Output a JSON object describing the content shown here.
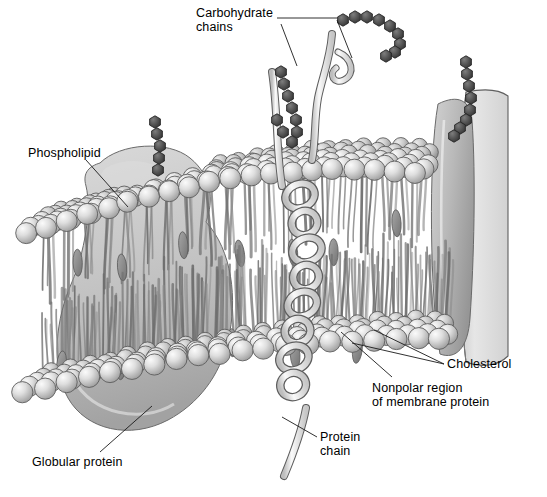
{
  "figure": {
    "background_color": "#ffffff",
    "ink_color": "#1a1a1a",
    "palette": {
      "head_light": "#e9e9e9",
      "head_mid": "#c6c6c6",
      "head_dark": "#8e8e8e",
      "tail_light": "#d8d8d8",
      "tail_dark": "#6f6f6f",
      "protein_fill": "#c0c0c0",
      "protein_shade": "#9a9a9a",
      "helix_fill": "#efefef",
      "carb_bead": "#555555",
      "cholesterol": "#8c8c8c",
      "cut_face": "#dcdcdc"
    }
  },
  "labels": [
    {
      "id": "carbohydrate-chains",
      "text": "Carbohydrate\nchains",
      "x": 196,
      "y": 6,
      "align": "left"
    },
    {
      "id": "phospholipid",
      "text": "Phospholipid",
      "x": 28,
      "y": 146,
      "align": "left"
    },
    {
      "id": "cholesterol",
      "text": "Cholesterol",
      "x": 447,
      "y": 357,
      "align": "left"
    },
    {
      "id": "nonpolar-region",
      "text": "Nonpolar region\nof membrane protein",
      "x": 372,
      "y": 381,
      "align": "left"
    },
    {
      "id": "protein-chain",
      "text": "Protein\nchain",
      "x": 320,
      "y": 430,
      "align": "left"
    },
    {
      "id": "globular-protein",
      "text": "Globular protein",
      "x": 32,
      "y": 455,
      "align": "left"
    }
  ],
  "leader_lines": [
    {
      "id": "leader-carbohydrate-top",
      "from": [
        277,
        18
      ],
      "to": [
        337,
        18
      ]
    },
    {
      "id": "leader-carbohydrate-left",
      "from": [
        281,
        24
      ],
      "to": [
        297,
        66
      ]
    },
    {
      "id": "leader-carbohydrate-right",
      "from": [
        337,
        20
      ],
      "to": [
        352,
        58
      ]
    },
    {
      "id": "leader-phospholipid",
      "from": [
        86,
        160
      ],
      "to": [
        128,
        207
      ]
    },
    {
      "id": "leader-cholesterol-a",
      "from": [
        444,
        364
      ],
      "to": [
        374,
        330
      ]
    },
    {
      "id": "leader-cholesterol-b",
      "from": [
        444,
        364
      ],
      "to": [
        352,
        343
      ]
    },
    {
      "id": "leader-nonpolar",
      "from": [
        392,
        377
      ],
      "to": [
        341,
        332
      ]
    },
    {
      "id": "leader-protein-chain",
      "from": [
        317,
        437
      ],
      "to": [
        282,
        417
      ]
    },
    {
      "id": "leader-globular-protein",
      "from": [
        100,
        452
      ],
      "to": [
        152,
        406
      ]
    }
  ],
  "structures": [
    {
      "id": "upper-leaflet",
      "name": "upper phospholipid leaflet",
      "heads": 132
    },
    {
      "id": "lower-leaflet",
      "name": "lower phospholipid leaflet",
      "heads": 96
    },
    {
      "id": "globular-protein",
      "name": "globular integral protein"
    },
    {
      "id": "helical-protein",
      "name": "alpha-helical transmembrane protein"
    },
    {
      "id": "edge-protein",
      "name": "right-edge integral protein slab"
    },
    {
      "id": "cut-face",
      "name": "membrane cut-away cross-section"
    }
  ],
  "carbohydrate_chains": [
    {
      "id": "carb-chain-left",
      "beads": 5,
      "anchor": [
        160,
        152
      ]
    },
    {
      "id": "carb-chain-middle",
      "beads": 9,
      "anchor": [
        330,
        35
      ]
    },
    {
      "id": "carb-chain-right",
      "beads": 8,
      "anchor": [
        462,
        60
      ]
    },
    {
      "id": "carb-chain-lower-left",
      "beads": 9,
      "anchor": [
        275,
        70
      ]
    }
  ],
  "cholesterol_count": 14
}
